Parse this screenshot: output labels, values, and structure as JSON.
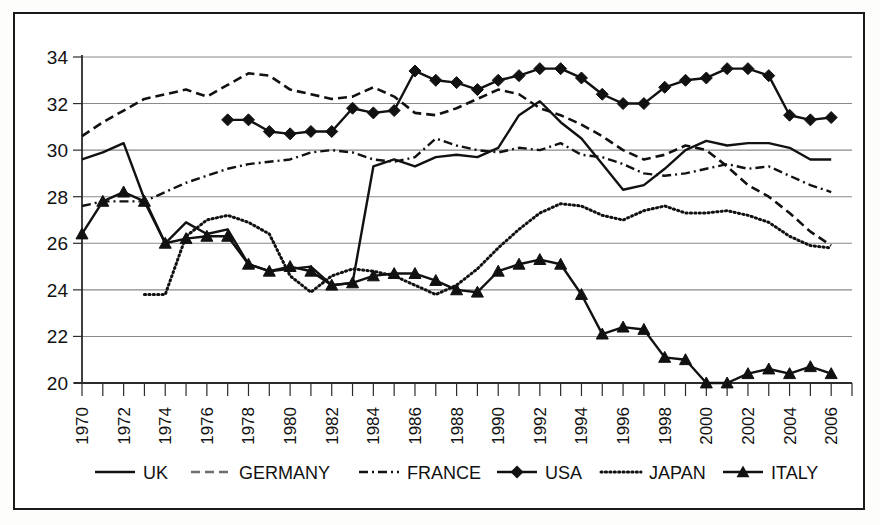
{
  "chart_data": {
    "type": "line",
    "title": "",
    "xlabel": "",
    "ylabel": "",
    "xlim": [
      1970,
      2007
    ],
    "ylim": [
      20,
      34
    ],
    "yticks": [
      20,
      22,
      24,
      26,
      28,
      30,
      32,
      34
    ],
    "xticks": [
      1970,
      1971,
      1972,
      1973,
      1974,
      1975,
      1976,
      1977,
      1978,
      1979,
      1980,
      1981,
      1982,
      1983,
      1984,
      1985,
      1986,
      1987,
      1988,
      1989,
      1990,
      1991,
      1992,
      1993,
      1994,
      1995,
      1996,
      1997,
      1998,
      1999,
      2000,
      2001,
      2002,
      2003,
      2004,
      2005,
      2006,
      2007
    ],
    "xtick_labels": [
      "1970",
      "1972",
      "1974",
      "1976",
      "1978",
      "1980",
      "1982",
      "1984",
      "1986",
      "1988",
      "1990",
      "1992",
      "1994",
      "1996",
      "1998",
      "2000",
      "2002",
      "2004",
      "2006"
    ],
    "xtick_label_years": [
      1970,
      1972,
      1974,
      1976,
      1978,
      1980,
      1982,
      1984,
      1986,
      1988,
      1990,
      1992,
      1994,
      1996,
      1998,
      2000,
      2002,
      2004,
      2006
    ],
    "grid": true,
    "grid_axis": "y",
    "legend_position": "bottom",
    "x": [
      1970,
      1971,
      1972,
      1973,
      1974,
      1975,
      1976,
      1977,
      1978,
      1979,
      1980,
      1981,
      1982,
      1983,
      1984,
      1985,
      1986,
      1987,
      1988,
      1989,
      1990,
      1991,
      1992,
      1993,
      1994,
      1995,
      1996,
      1997,
      1998,
      1999,
      2000,
      2001,
      2002,
      2003,
      2004,
      2005,
      2006
    ],
    "series": [
      {
        "name": "UK",
        "style": "solid",
        "marker": "none",
        "color": "#111111",
        "x": [
          1970,
          1971,
          1972,
          1973,
          1974,
          1975,
          1976,
          1977,
          1978,
          1979,
          1980,
          1981,
          1982,
          1983,
          1984,
          1985,
          1986,
          1987,
          1988,
          1989,
          1990,
          1991,
          1992,
          1993,
          1994,
          1995,
          1996,
          1997,
          1998,
          1999,
          2000,
          2001,
          2002,
          2003,
          2004,
          2005,
          2006
        ],
        "values": [
          29.6,
          29.9,
          30.3,
          27.9,
          26.0,
          26.9,
          26.4,
          26.6,
          25.1,
          24.8,
          24.9,
          25.0,
          24.2,
          24.3,
          29.3,
          29.6,
          29.3,
          29.7,
          29.8,
          29.7,
          30.1,
          31.5,
          32.1,
          31.2,
          30.5,
          29.4,
          28.3,
          28.5,
          29.2,
          30.0,
          30.4,
          30.2,
          30.3,
          30.3,
          30.1,
          29.6,
          29.6
        ]
      },
      {
        "name": "GERMANY",
        "style": "dashed",
        "marker": "none",
        "color": "#6e6e6e",
        "x": [
          1970,
          1971,
          1972,
          1973,
          1974,
          1975,
          1976,
          1977,
          1978,
          1979,
          1980,
          1981,
          1982,
          1983,
          1984,
          1985,
          1986,
          1987,
          1988,
          1989,
          1990,
          1991,
          1992,
          1993,
          1994,
          1995,
          1996,
          1997,
          1998,
          1999,
          2000,
          2001,
          2002,
          2003,
          2004,
          2005,
          2006
        ],
        "values": [
          30.6,
          31.2,
          31.7,
          32.2,
          32.4,
          32.6,
          32.3,
          32.8,
          33.3,
          33.2,
          32.6,
          32.4,
          32.2,
          32.3,
          32.7,
          32.3,
          31.6,
          31.5,
          31.8,
          32.2,
          32.6,
          32.4,
          31.8,
          31.5,
          31.1,
          30.6,
          30.0,
          29.6,
          29.8,
          30.2,
          30.0,
          29.3,
          28.5,
          28.0,
          27.3,
          26.5,
          25.9
        ]
      },
      {
        "name": "FRANCE",
        "style": "dashdot",
        "marker": "none",
        "color": "#111111",
        "x": [
          1970,
          1971,
          1972,
          1973,
          1974,
          1975,
          1976,
          1977,
          1978,
          1979,
          1980,
          1981,
          1982,
          1983,
          1984,
          1985,
          1986,
          1987,
          1988,
          1989,
          1990,
          1991,
          1992,
          1993,
          1994,
          1995,
          1996,
          1997,
          1998,
          1999,
          2000,
          2001,
          2002,
          2003,
          2004,
          2005,
          2006
        ],
        "values": [
          27.6,
          27.8,
          27.8,
          27.8,
          28.2,
          28.6,
          28.9,
          29.2,
          29.4,
          29.5,
          29.6,
          29.9,
          30.0,
          29.9,
          29.6,
          29.5,
          29.7,
          30.5,
          30.2,
          30.0,
          29.9,
          30.1,
          30.0,
          30.3,
          29.8,
          29.7,
          29.4,
          29.0,
          28.9,
          29.0,
          29.2,
          29.4,
          29.2,
          29.3,
          28.9,
          28.5,
          28.2
        ]
      },
      {
        "name": "USA",
        "style": "solid",
        "marker": "diamond",
        "color": "#111111",
        "x": [
          1977,
          1978,
          1979,
          1980,
          1981,
          1982,
          1983,
          1984,
          1985,
          1986,
          1987,
          1988,
          1989,
          1990,
          1991,
          1992,
          1993,
          1994,
          1995,
          1996,
          1997,
          1998,
          1999,
          2000,
          2001,
          2002,
          2003,
          2004,
          2005,
          2006
        ],
        "values": [
          31.3,
          31.3,
          30.8,
          30.7,
          30.8,
          30.8,
          31.8,
          31.6,
          31.7,
          33.4,
          33.0,
          32.9,
          32.6,
          33.0,
          33.2,
          33.5,
          33.5,
          33.1,
          32.4,
          32.0,
          32.0,
          32.7,
          33.0,
          33.1,
          33.5,
          33.5,
          33.2,
          31.5,
          31.3,
          31.4
        ]
      },
      {
        "name": "JAPAN",
        "style": "dotted",
        "marker": "none",
        "color": "#111111",
        "x": [
          1973,
          1974,
          1975,
          1976,
          1977,
          1978,
          1979,
          1980,
          1981,
          1982,
          1983,
          1984,
          1985,
          1986,
          1987,
          1988,
          1989,
          1990,
          1991,
          1992,
          1993,
          1994,
          1995,
          1996,
          1997,
          1998,
          1999,
          2000,
          2001,
          2002,
          2003,
          2004,
          2005,
          2006
        ],
        "values": [
          23.8,
          23.8,
          26.3,
          27.0,
          27.2,
          26.9,
          26.4,
          24.6,
          23.9,
          24.6,
          24.9,
          24.8,
          24.6,
          24.2,
          23.8,
          24.2,
          24.9,
          25.8,
          26.6,
          27.3,
          27.7,
          27.6,
          27.2,
          27.0,
          27.4,
          27.6,
          27.3,
          27.3,
          27.4,
          27.2,
          26.9,
          26.3,
          25.9,
          25.8
        ]
      },
      {
        "name": "ITALY",
        "style": "solid",
        "marker": "triangle",
        "color": "#111111",
        "x": [
          1970,
          1971,
          1972,
          1973,
          1974,
          1975,
          1976,
          1977,
          1978,
          1979,
          1980,
          1981,
          1982,
          1983,
          1984,
          1985,
          1986,
          1987,
          1988,
          1989,
          1990,
          1991,
          1992,
          1993,
          1994,
          1995,
          1996,
          1997,
          1998,
          1999,
          2000,
          2001,
          2002,
          2003,
          2004,
          2005,
          2006
        ],
        "values": [
          26.4,
          27.8,
          28.2,
          27.8,
          26.0,
          26.2,
          26.3,
          26.3,
          25.1,
          24.8,
          25.0,
          24.8,
          24.2,
          24.3,
          24.6,
          24.7,
          24.7,
          24.4,
          24.0,
          23.9,
          24.8,
          25.1,
          25.3,
          25.1,
          23.8,
          22.1,
          22.4,
          22.3,
          21.1,
          21.0,
          20.0,
          20.0,
          20.4,
          20.6,
          20.4,
          20.7,
          20.4
        ]
      }
    ]
  },
  "legend": {
    "items": [
      {
        "label": "UK",
        "style": "solid",
        "marker": "none"
      },
      {
        "label": "GERMANY",
        "style": "dashed",
        "marker": "none"
      },
      {
        "label": "FRANCE",
        "style": "dashdot",
        "marker": "none"
      },
      {
        "label": "USA",
        "style": "solid",
        "marker": "diamond"
      },
      {
        "label": "JAPAN",
        "style": "dotted",
        "marker": "none"
      },
      {
        "label": "ITALY",
        "style": "solid",
        "marker": "triangle"
      }
    ]
  }
}
